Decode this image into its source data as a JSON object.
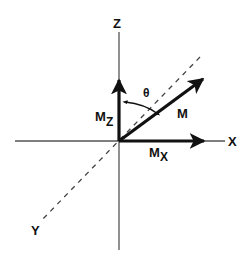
{
  "diagram": {
    "axes": {
      "z": {
        "label": "Z"
      },
      "x": {
        "label": "X"
      },
      "y": {
        "label": "Y",
        "style": "dashed"
      }
    },
    "vectors": {
      "m": {
        "label": "M"
      },
      "mz": {
        "label": "M",
        "subscript": "Z"
      },
      "mx": {
        "label": "M",
        "subscript": "X"
      }
    },
    "angle": {
      "label": "θ"
    },
    "colors": {
      "ink": "#111111",
      "axis": "#555555",
      "background": "#ffffff"
    }
  }
}
